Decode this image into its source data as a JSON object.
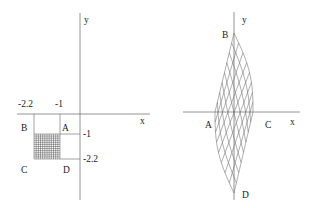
{
  "left_plot": {
    "axis_labels": {
      "x": "x",
      "y": "y"
    },
    "tick_labels": {
      "x_a": "-2.2",
      "x_b": "-1",
      "y_a": "-1",
      "y_b": "-2.2"
    },
    "vertex_labels": {
      "A": "A",
      "B": "B",
      "C": "C",
      "D": "D"
    },
    "grid_divisions": 12,
    "square": {
      "x_range": [
        -2.2,
        -1
      ],
      "y_range": [
        -2.2,
        -1
      ]
    }
  },
  "right_plot": {
    "axis_labels": {
      "x": "x",
      "y": "y"
    },
    "vertex_labels": {
      "A": "A",
      "B": "B",
      "C": "C",
      "D": "D"
    },
    "mesh_divisions": 8
  },
  "colors": {
    "axis": "#7a7a7a",
    "mesh": "#6a6a6a",
    "text": "#222222"
  }
}
